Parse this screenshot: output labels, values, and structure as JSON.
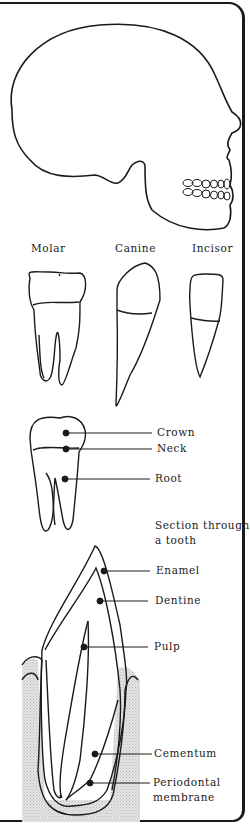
{
  "figure": {
    "skull": {
      "name": "skull-side-view"
    },
    "tooth_types": {
      "molar": "Molar",
      "canine": "Canine",
      "incisor": "Incisor"
    },
    "tooth_parts": {
      "crown": "Crown",
      "neck": "Neck",
      "root": "Root"
    },
    "section": {
      "title_line1": "Section through",
      "title_line2": "a tooth",
      "labels": {
        "enamel": "Enamel",
        "dentine": "Dentine",
        "pulp": "Pulp",
        "cementum": "Cementum",
        "periodontal_line1": "Periodontal",
        "periodontal_line2": "membrane"
      }
    },
    "colors": {
      "ink": "#1a1a1a",
      "gum": "#d6d6d6",
      "background": "#ffffff"
    }
  }
}
